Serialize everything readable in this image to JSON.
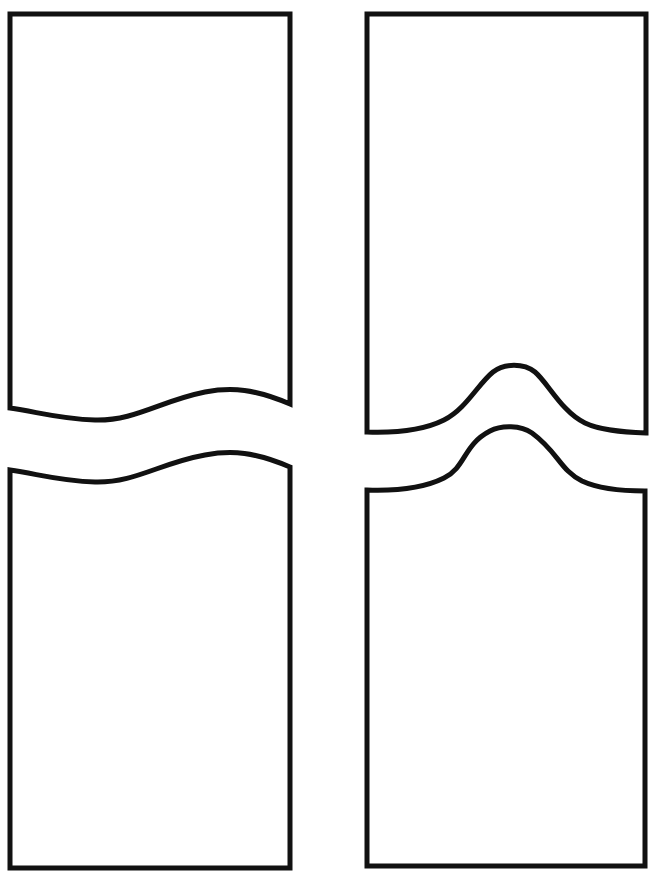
{
  "page": {
    "background_color": "#ffffff",
    "stroke_color": "#111111",
    "stroke_width": 5,
    "width": 667,
    "height": 879
  },
  "shapes": [
    {
      "id": "top-left",
      "name": "Gentle S-curve panel, top piece",
      "edge_type": "s-curve",
      "wavy_edge": "bottom",
      "rect": {
        "left": 10,
        "top": 14,
        "right": 290,
        "bottom": 408
      },
      "wave": {
        "start": {
          "x": 10,
          "y": 408
        },
        "trough": {
          "x": 95,
          "y": 420
        },
        "crest": {
          "x": 205,
          "y": 392
        },
        "end": {
          "x": 290,
          "y": 404
        }
      },
      "path": "M 10 14 L 290 14 L 290 404 C 255 389 232 387 205 392 C 160 401 135 421 95 420 C 60 419 38 412 10 408 Z"
    },
    {
      "id": "top-right",
      "name": "Bump-peak panel, top piece",
      "edge_type": "bump",
      "wavy_edge": "bottom",
      "rect": {
        "left": 367,
        "top": 14,
        "right": 646,
        "bottom": 434
      },
      "wave": {
        "start": {
          "x": 367,
          "y": 432
        },
        "peak": {
          "x": 513,
          "y": 367
        },
        "end": {
          "x": 646,
          "y": 433
        }
      },
      "path": "M 367 14 L 646 14 L 646 433 C 620 432 600 430 585 423 C 562 412 548 383 535 372 C 524 363 504 363 493 372 C 478 384 466 409 444 420 C 422 431 396 433 367 432 Z"
    },
    {
      "id": "bottom-left",
      "name": "Gentle S-curve panel, bottom piece",
      "edge_type": "s-curve",
      "wavy_edge": "top",
      "rect": {
        "left": 10,
        "top": 470,
        "right": 290,
        "bottom": 868
      },
      "wave": {
        "start": {
          "x": 10,
          "y": 470
        },
        "trough": {
          "x": 95,
          "y": 482
        },
        "crest": {
          "x": 205,
          "y": 455
        },
        "end": {
          "x": 290,
          "y": 467
        }
      },
      "path": "M 10 470 C 38 474 60 481 95 482 C 135 483 160 463 205 455 C 232 450 255 452 290 467 L 290 868 L 10 868 Z"
    },
    {
      "id": "bottom-right",
      "name": "Bump-peak panel, bottom piece",
      "edge_type": "bump",
      "wavy_edge": "top",
      "rect": {
        "left": 367,
        "top": 490,
        "right": 645,
        "bottom": 866
      },
      "wave": {
        "start": {
          "x": 367,
          "y": 490
        },
        "peak": {
          "x": 510,
          "y": 428
        },
        "end": {
          "x": 645,
          "y": 491
        }
      },
      "path": "M 367 490 C 396 491 422 489 444 478 C 466 467 463 445 490 431 C 501 425 521 425 532 433 C 558 452 560 470 582 481 C 597 488 619 491 645 491 L 645 866 L 367 866 Z"
    }
  ]
}
